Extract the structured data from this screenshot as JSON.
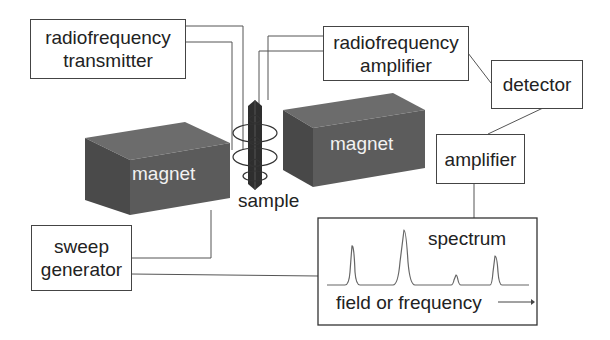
{
  "diagram": {
    "components": {
      "rf_transmitter": {
        "line1": "radiofrequency",
        "line2": "transmitter"
      },
      "rf_amplifier": {
        "line1": "radiofrequency",
        "line2": "amplifier"
      },
      "detector": {
        "label": "detector"
      },
      "amplifier": {
        "label": "amplifier"
      },
      "sweep_generator": {
        "line1": "sweep",
        "line2": "generator"
      },
      "magnet_left": {
        "label": "magnet"
      },
      "magnet_right": {
        "label": "magnet"
      },
      "sample": {
        "label": "sample"
      },
      "spectrum": {
        "title": "spectrum",
        "axis_label": "field or frequency"
      }
    },
    "connections": [
      [
        "radiofrequency transmitter",
        "sample coil"
      ],
      [
        "sample coil",
        "radiofrequency amplifier"
      ],
      [
        "radiofrequency amplifier",
        "detector"
      ],
      [
        "detector",
        "amplifier"
      ],
      [
        "amplifier",
        "spectrum"
      ],
      [
        "sweep generator",
        "magnet"
      ],
      [
        "sweep generator",
        "spectrum"
      ]
    ],
    "colors": {
      "magnet_front": "#5a5a5a",
      "magnet_top": "#6e6e6e",
      "magnet_side": "#474747",
      "line": "#555555"
    },
    "spectrum_peaks": [
      {
        "x_rel": 0.15,
        "height": "medium"
      },
      {
        "x_rel": 0.38,
        "height": "tall"
      },
      {
        "x_rel": 0.6,
        "height": "small"
      },
      {
        "x_rel": 0.78,
        "height": "medium"
      }
    ]
  }
}
